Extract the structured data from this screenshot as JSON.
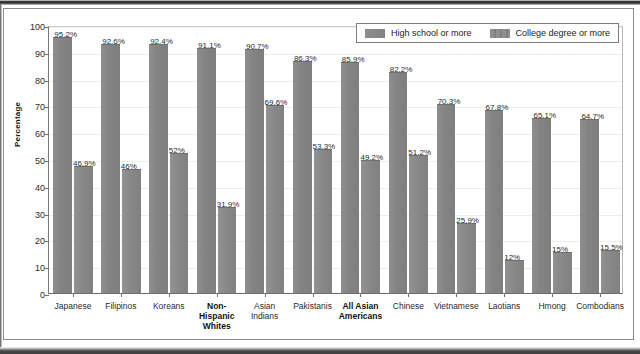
{
  "chart_data": {
    "type": "bar",
    "title": "",
    "xlabel": "",
    "ylabel": "Percentage",
    "ylim": [
      0,
      100
    ],
    "ytick_step": 10,
    "yticks": [
      0,
      10,
      20,
      30,
      40,
      50,
      60,
      70,
      80,
      90,
      100
    ],
    "grid": true,
    "legend_position": "top-right",
    "categories": [
      "Japanese",
      "Filipinos",
      "Koreans",
      "Non-Hispanic Whites",
      "Asian Indians",
      "Pakistanis",
      "All Asian Americans",
      "Chinese",
      "Vietnamese",
      "Laotians",
      "Hmong",
      "Combodians"
    ],
    "category_lines": [
      [
        "Japanese"
      ],
      [
        "Filipinos"
      ],
      [
        "Koreans"
      ],
      [
        "Non-",
        "Hispanic",
        "Whites"
      ],
      [
        "Asian",
        "Indians"
      ],
      [
        "Pakistanis"
      ],
      [
        "All Asian",
        "Americans"
      ],
      [
        "Chinese"
      ],
      [
        "Vietnamese"
      ],
      [
        "Laotians"
      ],
      [
        "Hmong"
      ],
      [
        "Combodians"
      ]
    ],
    "category_emphasis": [
      false,
      false,
      false,
      true,
      false,
      false,
      true,
      false,
      false,
      false,
      false,
      false
    ],
    "series": [
      {
        "name": "High school or more",
        "color": "#868686",
        "values": [
          95.2,
          92.6,
          92.4,
          91.1,
          90.7,
          86.3,
          85.9,
          82.2,
          70.3,
          67.8,
          65.1,
          64.7
        ],
        "labels": [
          "95.2%",
          "92.6%",
          "92.4%",
          "91.1%",
          "90.7%",
          "86.3%",
          "85.9%",
          "82.2%",
          "70.3%",
          "67.8%",
          "65.1%",
          "64.7%"
        ]
      },
      {
        "name": "College degree or more",
        "color": "#898989",
        "values": [
          46.9,
          46.0,
          52.0,
          31.9,
          69.6,
          53.3,
          49.2,
          51.2,
          25.9,
          12.0,
          15.0,
          15.5
        ],
        "labels": [
          "46.9%",
          "46%",
          "52%",
          "31.9%",
          "69.6%",
          "53.3%",
          "49.2%",
          "51.2%",
          "25.9%",
          "12%",
          "15%",
          "15.5%"
        ]
      }
    ]
  },
  "legend": {
    "entries": [
      {
        "label": "High school or more",
        "swatch": "legend-swatch-high-school"
      },
      {
        "label": "College degree or more",
        "swatch": "legend-swatch-college-degree"
      }
    ]
  }
}
